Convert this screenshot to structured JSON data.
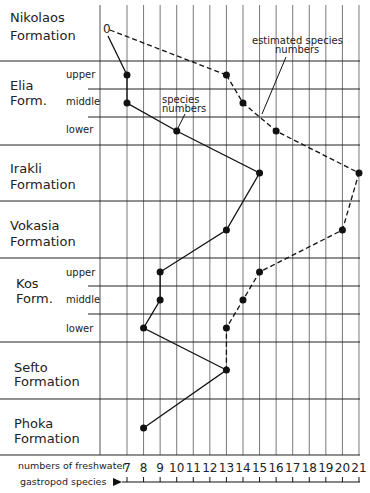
{
  "chart_data": {
    "type": "line",
    "title": "",
    "xlabel": "numbers of freshwater gastropod species",
    "ylabel": "",
    "x_ticks": [
      7,
      8,
      9,
      10,
      11,
      12,
      13,
      14,
      15,
      16,
      17,
      18,
      19,
      20,
      21
    ],
    "xlim": [
      6,
      21
    ],
    "grid": true,
    "categories": [
      "Nikolaos Formation",
      "Elia Form. upper",
      "Elia Form. middle",
      "Elia Form. lower",
      "Irakli Formation",
      "Vokasia Formation",
      "Kos Form. upper",
      "Kos Form. middle",
      "Kos Form. lower",
      "Sefto Formation",
      "Phoka Formation"
    ],
    "series": [
      {
        "name": "species numbers",
        "style": "solid",
        "values": [
          0,
          7,
          7,
          10,
          15,
          13,
          9,
          9,
          8,
          13,
          8
        ]
      },
      {
        "name": "estimated species numbers",
        "style": "dashed",
        "values": [
          0,
          13,
          14,
          16,
          21,
          20,
          15,
          14,
          13,
          13,
          null
        ]
      }
    ],
    "annotations": [
      "species numbers",
      "estimated species numbers"
    ]
  },
  "formations": [
    {
      "name1": "Nikolaos",
      "name2": "Formation"
    },
    {
      "name1": "Elia",
      "name2": "Form."
    },
    {
      "name1": "Irakli",
      "name2": "Formation"
    },
    {
      "name1": "Vokasia",
      "name2": "Formation"
    },
    {
      "name1": "Kos",
      "name2": "Form."
    },
    {
      "name1": "Sefto",
      "name2": "Formation"
    },
    {
      "name1": "Phoka",
      "name2": "Formation"
    }
  ],
  "sub": {
    "upper": "upper",
    "middle": "middle",
    "lower": "lower"
  },
  "zero_label": "0",
  "axis": {
    "line1": "numbers of freshwater",
    "line2": "gastropod  species"
  },
  "ann": {
    "species1": "species",
    "species2": "numbers",
    "est1": "estimated species",
    "est2": "numbers"
  }
}
